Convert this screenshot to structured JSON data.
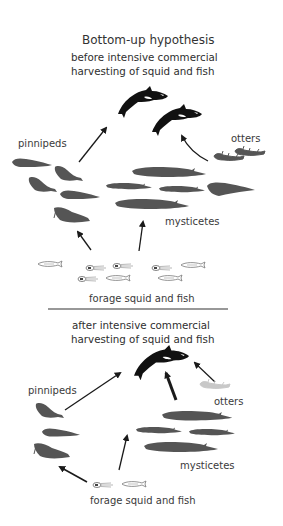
{
  "diagram": {
    "title": "Bottom-up hypothesis",
    "panels": [
      {
        "heading_line1": "before intensive commercial",
        "heading_line2": "harvesting of squid and fish",
        "labels": {
          "pinnipeds": "pinnipeds",
          "otters": "otters",
          "mysticetes": "mysticetes",
          "forage": "forage squid and fish"
        },
        "counts": {
          "orcas": 2,
          "pinnipeds": 5,
          "mysticetes": 5,
          "otters": 2,
          "forage_items": 9
        }
      },
      {
        "heading_line1": "after intensive commercial",
        "heading_line2": "harvesting of squid and fish",
        "labels": {
          "pinnipeds": "pinnipeds",
          "otters": "otters",
          "mysticetes": "mysticetes",
          "forage": "forage squid and fish"
        },
        "counts": {
          "orcas": 1,
          "pinnipeds": 3,
          "mysticetes": 4,
          "otters": 1,
          "forage_items": 2
        }
      }
    ],
    "colors": {
      "orca": "#111111",
      "animal_silhouette": "#555555",
      "otter_depleted": "#c8c8c8",
      "arrow": "#1a1a1a",
      "divider": "#333333",
      "forage_outline": "#777777"
    }
  }
}
